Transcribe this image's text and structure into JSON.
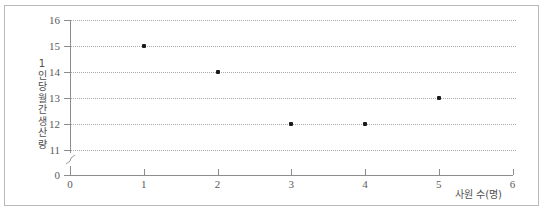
{
  "chart_data": {
    "type": "scatter",
    "title": "",
    "xlabel": "사원 수(명)",
    "ylabel": "1인당 월간 생산량",
    "ylabel_chars": [
      "1",
      "인",
      "당",
      "월",
      "간",
      "생",
      "산",
      "량"
    ],
    "x": [
      1,
      2,
      3,
      4,
      5
    ],
    "values": [
      15,
      14,
      12,
      12,
      13
    ],
    "points": [
      {
        "x": 1,
        "y": 15
      },
      {
        "x": 2,
        "y": 14
      },
      {
        "x": 3,
        "y": 12
      },
      {
        "x": 4,
        "y": 12
      },
      {
        "x": 5,
        "y": 13
      }
    ],
    "xlim": [
      0,
      6
    ],
    "xticks": [
      "0",
      "1",
      "2",
      "3",
      "4",
      "5",
      "6"
    ],
    "ylim": [
      11,
      16
    ],
    "yticks": [
      "16",
      "15",
      "14",
      "13",
      "12",
      "11",
      "0"
    ],
    "y_axis_break": true,
    "y_axis_break_between": [
      0,
      11
    ],
    "grid": true,
    "grid_style": "dotted",
    "grid_axis": "y",
    "legend": false,
    "marker": "square",
    "marker_color": "#1b1b1b",
    "grid_color": "#aaaaaa",
    "axis_color": "#8d8d8d",
    "frame_color": "#b9b9b9",
    "background": "#ffffff"
  }
}
